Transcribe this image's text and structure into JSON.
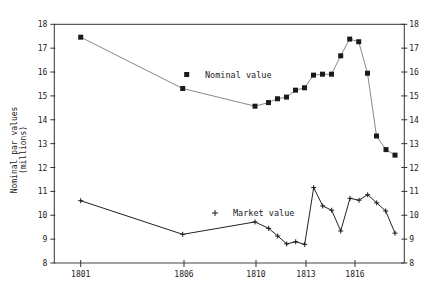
{
  "chart_data": {
    "type": "line",
    "title": "",
    "xlabel": "",
    "ylabel": "Nominal par values (millions)",
    "ylabel_lines": [
      "Nominal par values",
      "(millions)"
    ],
    "ylim": [
      8,
      18
    ],
    "yticks": [
      8,
      9,
      10,
      11,
      12,
      13,
      14,
      15,
      16,
      17,
      18
    ],
    "y_axis_both_sides": true,
    "grid": false,
    "xticks": [
      {
        "label": "1801",
        "px": 80.7
      },
      {
        "label": "1806",
        "px": 184
      },
      {
        "label": "1810",
        "px": 256
      },
      {
        "label": "1813",
        "px": 306
      },
      {
        "label": "1816",
        "px": 355
      }
    ],
    "legend_position": "inside",
    "series": [
      {
        "name": "Nominal value",
        "marker": "square",
        "color": "#1a1a1a",
        "line_color": "#555555",
        "x": [
          1801,
          1806,
          1810,
          1810.8,
          1811.3,
          1811.8,
          1812.4,
          1812.9,
          1813.5,
          1814.0,
          1814.6,
          1815.1,
          1815.7,
          1816.2,
          1816.8,
          1817.3,
          1817.9,
          1818.5
        ],
        "x_px": [
          80.7,
          182.7,
          255,
          268.5,
          277.5,
          286.5,
          295.5,
          304.5,
          313.5,
          322.5,
          331.5,
          340.7,
          349.7,
          358.7,
          367.5,
          376.5,
          386,
          395
        ],
        "values": [
          17.46,
          15.31,
          14.57,
          14.72,
          14.88,
          14.95,
          15.24,
          15.34,
          15.87,
          15.91,
          15.91,
          16.68,
          17.38,
          17.27,
          15.95,
          13.32,
          12.75,
          12.52
        ]
      },
      {
        "name": "Market value",
        "marker": "plus",
        "color": "#1a1a1a",
        "line_color": "#222222",
        "x": [
          1801,
          1806,
          1810,
          1810.8,
          1811.3,
          1811.8,
          1812.4,
          1812.9,
          1813.5,
          1814.0,
          1814.6,
          1815.1,
          1815.7,
          1816.2,
          1816.8,
          1817.3,
          1817.9,
          1818.5
        ],
        "x_px": [
          80.7,
          182.7,
          255,
          268.7,
          277.7,
          286.7,
          295.7,
          304.7,
          313.7,
          322.7,
          331.7,
          340.7,
          350,
          359,
          367.7,
          376.7,
          385.7,
          395
        ],
        "values": [
          10.61,
          9.2,
          9.72,
          9.45,
          9.13,
          8.8,
          8.89,
          8.78,
          11.16,
          10.39,
          10.21,
          9.34,
          10.71,
          10.63,
          10.86,
          10.52,
          10.18,
          9.25
        ]
      }
    ],
    "legend": [
      {
        "label": "Nominal value",
        "marker": "square",
        "marker_px": [
          186.7,
          74.5
        ],
        "text_px": [
          205,
          77.5
        ]
      },
      {
        "label": "Market value",
        "marker": "plus",
        "marker_px": [
          215,
          213
        ],
        "text_px": [
          233,
          216
        ]
      }
    ]
  }
}
